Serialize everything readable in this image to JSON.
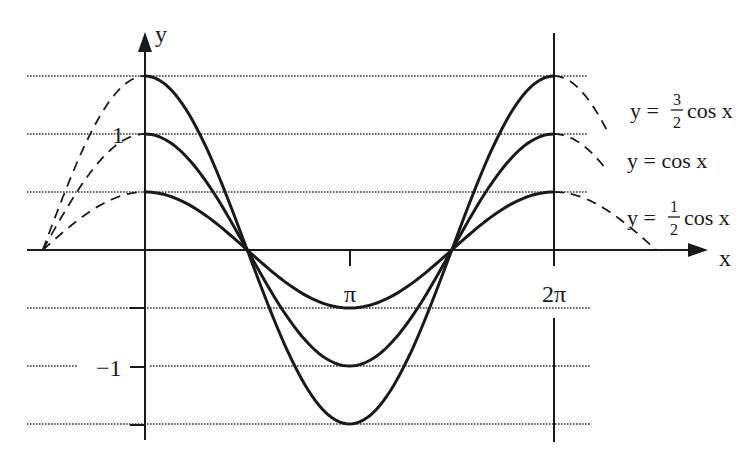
{
  "chart_data": {
    "type": "line",
    "title": "",
    "xlabel": "x",
    "ylabel": "y",
    "x_ticks": [
      {
        "value": 3.14159,
        "label": "π"
      },
      {
        "value": 6.28319,
        "label": "2π"
      }
    ],
    "y_ticks": [
      {
        "value": 1,
        "label": "1"
      },
      {
        "value": -1,
        "label": "−1"
      }
    ],
    "gridlines_y": [
      1.5,
      1,
      0.5,
      -0.5,
      -1,
      -1.5
    ],
    "xlim": [
      -1.5708,
      7.85
    ],
    "ylim": [
      -1.5,
      1.5
    ],
    "series": [
      {
        "name": "y = 3/2 cos x",
        "amplitude": 1.5,
        "solid_range": [
          0,
          6.28319
        ],
        "dashed_left": [
          -1.5708,
          0
        ],
        "dashed_right": [
          6.28319,
          7.1
        ]
      },
      {
        "name": "y = cos x",
        "amplitude": 1.0,
        "solid_range": [
          0,
          6.28319
        ],
        "dashed_left": [
          -1.5708,
          0
        ],
        "dashed_right": [
          6.28319,
          7.1
        ]
      },
      {
        "name": "y = 1/2 cos x",
        "amplitude": 0.5,
        "solid_range": [
          0,
          6.28319
        ],
        "dashed_left": [
          -1.5708,
          0
        ],
        "dashed_right": [
          6.28319,
          7.85398
        ]
      }
    ],
    "legend": [
      {
        "prefix": "y =",
        "num": "3",
        "den": "2",
        "suffix": "cos x"
      },
      {
        "prefix": "y = cos x",
        "num": "",
        "den": "",
        "suffix": ""
      },
      {
        "prefix": "y =",
        "num": "1",
        "den": "2",
        "suffix": "cos x"
      }
    ],
    "legend_position": "right",
    "grid": true
  }
}
